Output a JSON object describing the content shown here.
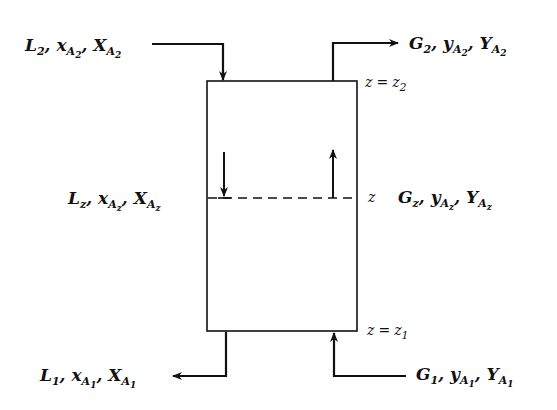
{
  "diagram": {
    "type": "countercurrent-column-material-balance",
    "colors": {
      "line": "#111111",
      "background": "#ffffff"
    },
    "streams": {
      "top_liquid_in": {
        "label": "L",
        "sub": "2",
        "comp1": "x",
        "comp1_sub": "A",
        "comp1_subsub": "2",
        "comp2": "X",
        "comp2_sub": "A",
        "comp2_subsub": "2",
        "direction": "in"
      },
      "top_gas_out": {
        "label": "G",
        "sub": "2",
        "comp1": "y",
        "comp1_sub": "A",
        "comp1_subsub": "2",
        "comp2": "Y",
        "comp2_sub": "A",
        "comp2_subsub": "2",
        "direction": "out"
      },
      "mid_liquid": {
        "label": "L",
        "sub": "z",
        "comp1": "x",
        "comp1_sub": "A",
        "comp1_subsub": "z",
        "comp2": "X",
        "comp2_sub": "A",
        "comp2_subsub": "z",
        "direction": "down"
      },
      "mid_gas": {
        "label": "G",
        "sub": "z",
        "comp1": "y",
        "comp1_sub": "A",
        "comp1_subsub": "z",
        "comp2": "Y",
        "comp2_sub": "A",
        "comp2_subsub": "z",
        "direction": "up"
      },
      "bottom_liquid_out": {
        "label": "L",
        "sub": "1",
        "comp1": "x",
        "comp1_sub": "A",
        "comp1_subsub": "1",
        "comp2": "X",
        "comp2_sub": "A",
        "comp2_subsub": "1",
        "direction": "out"
      },
      "bottom_gas_in": {
        "label": "G",
        "sub": "1",
        "comp1": "y",
        "comp1_sub": "A",
        "comp1_subsub": "1",
        "comp2": "Y",
        "comp2_sub": "A",
        "comp2_subsub": "1",
        "direction": "in"
      }
    },
    "positions": {
      "top": {
        "var": "z",
        "eq": "=",
        "val": "z",
        "sub": "2"
      },
      "mid": {
        "var": "z"
      },
      "bottom": {
        "var": "z",
        "eq": "=",
        "val": "z",
        "sub": "1"
      }
    },
    "separator": ", "
  }
}
